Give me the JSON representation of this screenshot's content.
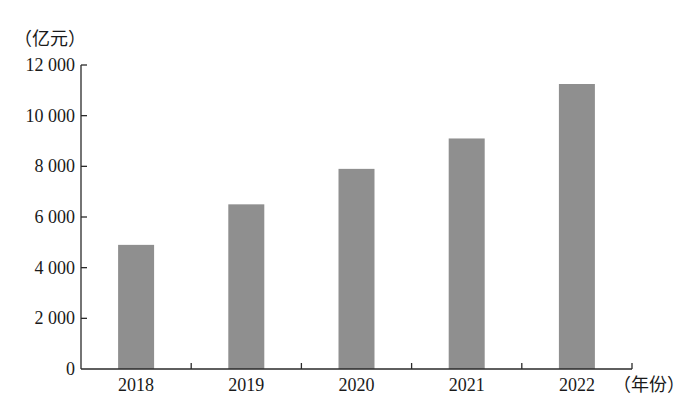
{
  "chart_data": {
    "type": "bar",
    "title": "",
    "xlabel": "（年份）",
    "ylabel": "（亿元）",
    "categories": [
      "2018",
      "2019",
      "2020",
      "2021",
      "2022"
    ],
    "values": [
      4900,
      6500,
      7900,
      9100,
      11250
    ],
    "ylim": [
      0,
      12000
    ],
    "yticks": [
      0,
      2000,
      4000,
      6000,
      8000,
      10000,
      12000
    ],
    "ytick_labels": [
      "0",
      "2 000",
      "4 000",
      "6 000",
      "8 000",
      "10 000",
      "12 000"
    ],
    "grid": false,
    "legend": null,
    "bar_color": "#8f8f8f"
  }
}
